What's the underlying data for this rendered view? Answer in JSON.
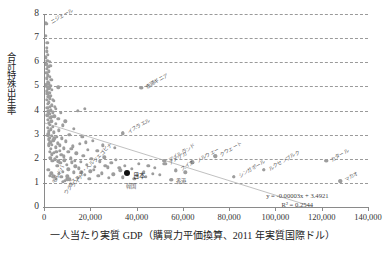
{
  "chart_data": {
    "type": "scatter",
    "title": "",
    "xlabel": "一人当たり実質 GDP（購買力平価換算、2011 年実質国際ドル）",
    "ylabel": "合計特殊出生率",
    "xlim": [
      0,
      140000
    ],
    "ylim": [
      0,
      8
    ],
    "grid": true,
    "legend": "none",
    "xticks": [
      "0",
      "20,000",
      "40,000",
      "60,000",
      "80,000",
      "100,000",
      "120,000",
      "140,000"
    ],
    "xtick_values": [
      0,
      20000,
      40000,
      60000,
      80000,
      100000,
      120000,
      140000
    ],
    "yticks": [
      "0",
      "1",
      "2",
      "3",
      "4",
      "5",
      "6",
      "7",
      "8"
    ],
    "ytick_values": [
      0,
      1,
      2,
      3,
      4,
      5,
      6,
      7,
      8
    ],
    "trendline": {
      "equation": "y = -0.00003x + 3.4921",
      "r_squared": "R² = 0.2544",
      "slope": -3e-05,
      "intercept": 3.4921,
      "x_from": 0,
      "x_to": 116000
    },
    "labeled_points": [
      {
        "label": "ニジェール",
        "x": 1000,
        "y": 7.6,
        "rot": "rot",
        "dx": 5,
        "dy": -4
      },
      {
        "label": "赤道ギニア",
        "x": 42000,
        "y": 4.95,
        "rot": "rot",
        "dx": 5,
        "dy": -3
      },
      {
        "label": "イスラエル",
        "x": 34000,
        "y": 3.05,
        "rot": "rot",
        "dx": 5,
        "dy": -3
      },
      {
        "label": "クウェート",
        "x": 74000,
        "y": 2.12,
        "rot": "rot",
        "dx": 5,
        "dy": -3
      },
      {
        "label": "ノルウェー",
        "x": 64000,
        "y": 1.85,
        "rot": "rot",
        "dx": 5,
        "dy": -3
      },
      {
        "label": "アイルランド",
        "x": 52000,
        "y": 1.92,
        "rot": "rot",
        "dx": 5,
        "dy": -3
      },
      {
        "label": "スイス",
        "x": 57000,
        "y": 1.52,
        "rot": "rot",
        "dx": 5,
        "dy": -3
      },
      {
        "label": "シンガポール",
        "x": 82000,
        "y": 1.25,
        "rot": "rot",
        "dx": 5,
        "dy": -3
      },
      {
        "label": "ルクセンブルク",
        "x": 95000,
        "y": 1.55,
        "rot": "rot",
        "dx": 5,
        "dy": -3
      },
      {
        "label": "カタール",
        "x": 122000,
        "y": 1.92,
        "rot": "rot",
        "dx": 5,
        "dy": -3
      },
      {
        "label": "マカオ",
        "x": 128000,
        "y": 1.08,
        "rot": "rot",
        "dx": 5,
        "dy": -3
      },
      {
        "label": "アメリカ",
        "x": 52000,
        "y": 1.78,
        "rot": "rot",
        "dx": 5,
        "dy": -3
      },
      {
        "label": "香港",
        "x": 55000,
        "y": 1.13,
        "rot": "none",
        "dx": 5,
        "dy": -1
      },
      {
        "label": "日本",
        "x": 36000,
        "y": 1.42,
        "rot": "none",
        "dx": 6,
        "dy": 0,
        "highlight": true
      },
      {
        "label": "韓国",
        "x": 34000,
        "y": 1.22,
        "rot": "none",
        "dx": 3,
        "dy": 6
      },
      {
        "label": "モルドバ",
        "x": 4000,
        "y": 1.27,
        "rot": "rot60",
        "dx": 1,
        "dy": 5
      },
      {
        "label": "ボスニア・ヘルツェゴビナ",
        "x": 10000,
        "y": 1.15,
        "rot": "rot45",
        "dx": 2,
        "dy": 5
      },
      {
        "label": "ウクライナ",
        "x": 8000,
        "y": 1.05,
        "rot": "rot45",
        "dx": 2,
        "dy": 9
      }
    ],
    "points": [
      {
        "x": 760,
        "y": 7.63
      },
      {
        "x": 900,
        "y": 7.1
      },
      {
        "x": 1400,
        "y": 6.8
      },
      {
        "x": 1150,
        "y": 6.45
      },
      {
        "x": 800,
        "y": 6.2
      },
      {
        "x": 1500,
        "y": 6.05
      },
      {
        "x": 2400,
        "y": 6.02
      },
      {
        "x": 1000,
        "y": 5.92
      },
      {
        "x": 1800,
        "y": 5.8
      },
      {
        "x": 1300,
        "y": 5.72
      },
      {
        "x": 2200,
        "y": 5.62
      },
      {
        "x": 950,
        "y": 5.55
      },
      {
        "x": 1700,
        "y": 5.46
      },
      {
        "x": 2600,
        "y": 5.4
      },
      {
        "x": 1200,
        "y": 5.33
      },
      {
        "x": 3100,
        "y": 5.28
      },
      {
        "x": 1600,
        "y": 5.2
      },
      {
        "x": 2000,
        "y": 5.12
      },
      {
        "x": 900,
        "y": 5.05
      },
      {
        "x": 2800,
        "y": 5.02
      },
      {
        "x": 1400,
        "y": 4.98
      },
      {
        "x": 6200,
        "y": 4.96
      },
      {
        "x": 42000,
        "y": 4.94
      },
      {
        "x": 1900,
        "y": 4.9
      },
      {
        "x": 3500,
        "y": 4.86
      },
      {
        "x": 1100,
        "y": 4.8
      },
      {
        "x": 2300,
        "y": 4.74
      },
      {
        "x": 1500,
        "y": 4.68
      },
      {
        "x": 3000,
        "y": 4.62
      },
      {
        "x": 1800,
        "y": 4.56
      },
      {
        "x": 2600,
        "y": 4.5
      },
      {
        "x": 1250,
        "y": 4.44
      },
      {
        "x": 4200,
        "y": 4.4
      },
      {
        "x": 2100,
        "y": 4.34
      },
      {
        "x": 1650,
        "y": 4.28
      },
      {
        "x": 3300,
        "y": 4.22
      },
      {
        "x": 2450,
        "y": 4.16
      },
      {
        "x": 1350,
        "y": 4.1
      },
      {
        "x": 5200,
        "y": 4.06
      },
      {
        "x": 2900,
        "y": 4.02
      },
      {
        "x": 14500,
        "y": 4.0
      },
      {
        "x": 17500,
        "y": 4.06
      },
      {
        "x": 1900,
        "y": 3.96
      },
      {
        "x": 3700,
        "y": 3.92
      },
      {
        "x": 2300,
        "y": 3.86
      },
      {
        "x": 1500,
        "y": 3.8
      },
      {
        "x": 4500,
        "y": 3.76
      },
      {
        "x": 2700,
        "y": 3.7
      },
      {
        "x": 6200,
        "y": 3.66
      },
      {
        "x": 1750,
        "y": 3.62
      },
      {
        "x": 3200,
        "y": 3.56
      },
      {
        "x": 2100,
        "y": 3.5
      },
      {
        "x": 5000,
        "y": 3.46
      },
      {
        "x": 2500,
        "y": 3.4
      },
      {
        "x": 8000,
        "y": 3.38
      },
      {
        "x": 3800,
        "y": 3.32
      },
      {
        "x": 1600,
        "y": 3.28
      },
      {
        "x": 2900,
        "y": 3.22
      },
      {
        "x": 6500,
        "y": 3.18
      },
      {
        "x": 2200,
        "y": 3.14
      },
      {
        "x": 4300,
        "y": 3.1
      },
      {
        "x": 34000,
        "y": 3.06
      },
      {
        "x": 1800,
        "y": 3.02
      },
      {
        "x": 11000,
        "y": 3.0
      },
      {
        "x": 3300,
        "y": 2.96
      },
      {
        "x": 5600,
        "y": 2.92
      },
      {
        "x": 2400,
        "y": 2.88
      },
      {
        "x": 7800,
        "y": 2.84
      },
      {
        "x": 1950,
        "y": 2.8
      },
      {
        "x": 4000,
        "y": 2.76
      },
      {
        "x": 9500,
        "y": 2.72
      },
      {
        "x": 2800,
        "y": 2.68
      },
      {
        "x": 6000,
        "y": 2.64
      },
      {
        "x": 15500,
        "y": 2.62
      },
      {
        "x": 3500,
        "y": 2.58
      },
      {
        "x": 2100,
        "y": 2.54
      },
      {
        "x": 12500,
        "y": 2.52
      },
      {
        "x": 5000,
        "y": 2.48
      },
      {
        "x": 8500,
        "y": 2.44
      },
      {
        "x": 3000,
        "y": 2.4
      },
      {
        "x": 19000,
        "y": 2.38
      },
      {
        "x": 6800,
        "y": 2.34
      },
      {
        "x": 2500,
        "y": 2.3
      },
      {
        "x": 23000,
        "y": 2.33
      },
      {
        "x": 10500,
        "y": 2.28
      },
      {
        "x": 4200,
        "y": 2.24
      },
      {
        "x": 14000,
        "y": 2.22
      },
      {
        "x": 3300,
        "y": 2.18
      },
      {
        "x": 7500,
        "y": 2.16
      },
      {
        "x": 17000,
        "y": 2.12
      },
      {
        "x": 74000,
        "y": 2.1
      },
      {
        "x": 5500,
        "y": 2.08
      },
      {
        "x": 26000,
        "y": 2.06
      },
      {
        "x": 2800,
        "y": 2.04
      },
      {
        "x": 11500,
        "y": 2.02
      },
      {
        "x": 20500,
        "y": 2.0
      },
      {
        "x": 4600,
        "y": 1.98
      },
      {
        "x": 31000,
        "y": 1.96
      },
      {
        "x": 8800,
        "y": 1.94
      },
      {
        "x": 122000,
        "y": 1.92
      },
      {
        "x": 6200,
        "y": 1.9
      },
      {
        "x": 16000,
        "y": 1.88
      },
      {
        "x": 64000,
        "y": 1.86
      },
      {
        "x": 3600,
        "y": 1.92
      },
      {
        "x": 24000,
        "y": 1.9
      },
      {
        "x": 52000,
        "y": 1.91
      },
      {
        "x": 12000,
        "y": 1.86
      },
      {
        "x": 29000,
        "y": 1.84
      },
      {
        "x": 7000,
        "y": 1.82
      },
      {
        "x": 41000,
        "y": 1.8
      },
      {
        "x": 52500,
        "y": 1.78
      },
      {
        "x": 18500,
        "y": 1.76
      },
      {
        "x": 9800,
        "y": 1.74
      },
      {
        "x": 35000,
        "y": 1.72
      },
      {
        "x": 45000,
        "y": 1.7
      },
      {
        "x": 13500,
        "y": 1.68
      },
      {
        "x": 22000,
        "y": 1.66
      },
      {
        "x": 5800,
        "y": 1.72
      },
      {
        "x": 27500,
        "y": 1.64
      },
      {
        "x": 48000,
        "y": 1.62
      },
      {
        "x": 15000,
        "y": 1.6
      },
      {
        "x": 38000,
        "y": 1.58
      },
      {
        "x": 10500,
        "y": 1.56
      },
      {
        "x": 95000,
        "y": 1.54
      },
      {
        "x": 33000,
        "y": 1.52
      },
      {
        "x": 57000,
        "y": 1.5
      },
      {
        "x": 20000,
        "y": 1.48
      },
      {
        "x": 43000,
        "y": 1.46
      },
      {
        "x": 12800,
        "y": 1.44
      },
      {
        "x": 36000,
        "y": 1.42
      },
      {
        "x": 25000,
        "y": 1.4
      },
      {
        "x": 8200,
        "y": 1.46
      },
      {
        "x": 47000,
        "y": 1.38
      },
      {
        "x": 30000,
        "y": 1.36
      },
      {
        "x": 17500,
        "y": 1.34
      },
      {
        "x": 6500,
        "y": 1.38
      },
      {
        "x": 40000,
        "y": 1.32
      },
      {
        "x": 23500,
        "y": 1.3
      },
      {
        "x": 10000,
        "y": 1.28
      },
      {
        "x": 4000,
        "y": 1.26
      },
      {
        "x": 34000,
        "y": 1.24
      },
      {
        "x": 14500,
        "y": 1.22
      },
      {
        "x": 28000,
        "y": 1.2
      },
      {
        "x": 7500,
        "y": 1.24
      },
      {
        "x": 19500,
        "y": 1.18
      },
      {
        "x": 82000,
        "y": 1.24
      },
      {
        "x": 55000,
        "y": 1.12
      },
      {
        "x": 11000,
        "y": 1.14
      },
      {
        "x": 2600,
        "y": 1.3
      },
      {
        "x": 5200,
        "y": 1.18
      },
      {
        "x": 9000,
        "y": 1.08
      },
      {
        "x": 128000,
        "y": 1.06
      },
      {
        "x": 3200,
        "y": 1.4
      },
      {
        "x": 1800,
        "y": 1.55
      },
      {
        "x": 2200,
        "y": 2.6
      },
      {
        "x": 1600,
        "y": 2.95
      },
      {
        "x": 2000,
        "y": 4.6
      },
      {
        "x": 1400,
        "y": 5.1
      },
      {
        "x": 2700,
        "y": 5.85
      },
      {
        "x": 1100,
        "y": 6.6
      },
      {
        "x": 16500,
        "y": 2.9
      },
      {
        "x": 21000,
        "y": 2.75
      },
      {
        "x": 13000,
        "y": 3.25
      },
      {
        "x": 9200,
        "y": 3.55
      },
      {
        "x": 25500,
        "y": 2.55
      },
      {
        "x": 30500,
        "y": 2.45
      },
      {
        "x": 18000,
        "y": 2.68
      },
      {
        "x": 7200,
        "y": 3.9
      },
      {
        "x": 4800,
        "y": 4.15
      },
      {
        "x": 3900,
        "y": 4.45
      },
      {
        "x": 5400,
        "y": 2.3
      },
      {
        "x": 6900,
        "y": 2.55
      },
      {
        "x": 11800,
        "y": 2.4
      },
      {
        "x": 8600,
        "y": 2.1
      },
      {
        "x": 4400,
        "y": 2.85
      },
      {
        "x": 3100,
        "y": 3.75
      },
      {
        "x": 2300,
        "y": 4.95
      },
      {
        "x": 1700,
        "y": 6.3
      },
      {
        "x": 13200,
        "y": 1.92
      },
      {
        "x": 26500,
        "y": 1.72
      },
      {
        "x": 32500,
        "y": 1.62
      },
      {
        "x": 21500,
        "y": 1.55
      },
      {
        "x": 16200,
        "y": 1.44
      },
      {
        "x": 44000,
        "y": 1.26
      },
      {
        "x": 50000,
        "y": 1.34
      },
      {
        "x": 61000,
        "y": 1.44
      },
      {
        "x": 39000,
        "y": 1.18
      }
    ]
  }
}
